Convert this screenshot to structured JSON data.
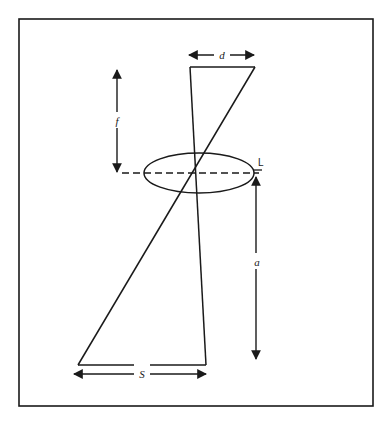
{
  "figure": {
    "background_color": "#ffffff",
    "stroke_color": "#1a1a1a",
    "frame": {
      "name": "outer-border",
      "x": 19,
      "y": 19,
      "width": 354,
      "height": 387,
      "stroke_width": 1.6
    },
    "labels": {
      "d": "d",
      "f": "f",
      "a": "a",
      "S": "S",
      "L": "L"
    },
    "geometry": {
      "top_left_vertex": [
        190,
        67
      ],
      "top_right_vertex": [
        255,
        67
      ],
      "crossing_point": [
        197,
        173
      ],
      "bottom_left_vertex": [
        78,
        365
      ],
      "bottom_right_vertex": [
        206,
        365
      ],
      "ellipse_center": [
        199,
        173
      ],
      "ellipse_rx": 55,
      "ellipse_ry": 20
    },
    "dimensions": {
      "d": {
        "axis": "horizontal",
        "y": 55,
        "x1": 189,
        "x2": 254
      },
      "f": {
        "axis": "vertical",
        "x": 117,
        "y1": 70,
        "y2": 172
      },
      "a": {
        "axis": "vertical",
        "x": 256,
        "y1": 177,
        "y2": 359
      },
      "S": {
        "axis": "horizontal",
        "y": 374,
        "x1": 74,
        "x2": 206
      }
    },
    "centerline": {
      "y": 173,
      "x1": 122,
      "x2": 259,
      "style": "dashed"
    }
  }
}
